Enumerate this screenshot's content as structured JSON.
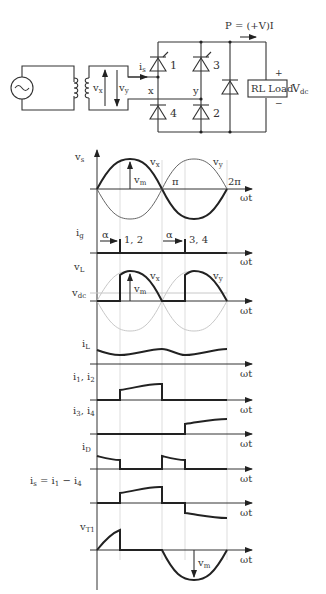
{
  "circuit": {
    "power_label": "P = (+V)I",
    "source": "ac-source",
    "transformer_secondary_labels": {
      "vx": "v",
      "vx_sub": "x",
      "vy": "v",
      "vy_sub": "y"
    },
    "current_label": "i",
    "current_sub": "s",
    "node_x": "x",
    "node_y": "y",
    "thyristors": [
      "1",
      "3"
    ],
    "diodes": [
      "4",
      "2"
    ],
    "freewheel_diode": "D",
    "load_label": "RL Load",
    "vdc_label": "V",
    "vdc_sub": "dc",
    "plus": "+",
    "minus": "−"
  },
  "waveforms": {
    "omega_t": "ωt",
    "vs": {
      "label": "v",
      "sub": "s",
      "vx": "v",
      "vx_sub": "x",
      "vy": "v",
      "vy_sub": "y",
      "vm": "v",
      "vm_sub": "m",
      "pi": "π",
      "two_pi": "2π"
    },
    "ig": {
      "label": "i",
      "sub": "g",
      "alpha": "α",
      "pulse1": "1, 2",
      "pulse2": "3, 4"
    },
    "vL": {
      "label": "v",
      "sub": "L",
      "vdc": "v",
      "vdc_sub": "dc",
      "vx": "v",
      "vx_sub": "x",
      "vy": "v",
      "vy_sub": "y",
      "vm": "v",
      "vm_sub": "m"
    },
    "iL": {
      "label": "i",
      "sub": "L"
    },
    "i12": {
      "label": "i",
      "sub1": "1",
      "sep": ", i",
      "sub2": "2"
    },
    "i34": {
      "label": "i",
      "sub1": "3",
      "sep": ", i",
      "sub2": "4"
    },
    "iD": {
      "label": "i",
      "sub": "D"
    },
    "is": {
      "label": "i",
      "sub": "s",
      "eq": " = i",
      "sub1": "1",
      "minus": " − i",
      "sub2": "4"
    },
    "vT1": {
      "label": "v",
      "sub": "T1",
      "vm": "v",
      "vm_sub": "m"
    }
  }
}
